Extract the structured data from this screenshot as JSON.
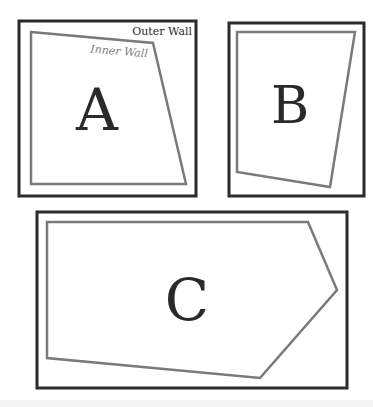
{
  "diagram": {
    "rooms": [
      {
        "label": "A",
        "outer_wall": {
          "x": 19,
          "y": 21,
          "width": 177,
          "height": 175
        },
        "inner_wall_points": "31,32 153,43 186,184 31,184",
        "label_pos": {
          "x": 97,
          "y": 130
        },
        "font_size": 58
      },
      {
        "label": "B",
        "outer_wall": {
          "x": 229,
          "y": 23,
          "width": 135,
          "height": 173
        },
        "inner_wall_points": "237,32 355,32 330,187 237,172",
        "label_pos": {
          "x": 290,
          "y": 123
        },
        "font_size": 52
      },
      {
        "label": "C",
        "outer_wall": {
          "x": 37,
          "y": 212,
          "width": 310,
          "height": 176
        },
        "inner_wall_points": "47,222 308,222 337,290 260,378 47,358",
        "label_pos": {
          "x": 187,
          "y": 320
        },
        "font_size": 58
      }
    ],
    "annotations": {
      "outer_wall_label": "Outer Wall",
      "inner_wall_label": "Inner Wall"
    },
    "colors": {
      "outer_wall": "#2b2b2b",
      "inner_wall": "#7a7a7a",
      "room_label": "#2a2a2a",
      "background": "#ffffff"
    }
  }
}
